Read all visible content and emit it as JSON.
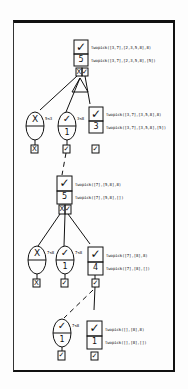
{
  "diagram": {
    "title": "",
    "nodes": {
      "n1": {
        "status_icon": "check",
        "count": "5",
        "goal": "twopick([3,7],[2,3,5,8],8)",
        "result": "twopick([3,7],[2,3,5,8],[5])",
        "children_marks": [
          "X",
          "✓"
        ]
      },
      "n1a": {
        "type": "test",
        "status_icon": "cross",
        "cond": "5<3",
        "count": "",
        "mark": "X"
      },
      "n1b": {
        "type": "test",
        "status_icon": "check",
        "cond": "3<8",
        "count": "1",
        "mark": "✓"
      },
      "n1c": {
        "status_icon": "check",
        "count": "3",
        "goal": "twopick([3,7],[3,5,8],8)",
        "result": "twopick([3,7],[3,5,8],[5])",
        "mark": "✓"
      },
      "n2": {
        "status_icon": "check",
        "count": "5",
        "goal": "twopick([7],[5,8],8)",
        "result": "twopick([7],[5,8],[])",
        "children_marks": [
          "X",
          "✓"
        ]
      },
      "n2a": {
        "type": "test",
        "status_icon": "cross",
        "cond": "7<8",
        "count": "",
        "mark": "X"
      },
      "n2b": {
        "type": "test",
        "status_icon": "check",
        "cond": "7<8",
        "count": "1",
        "mark": "✓"
      },
      "n2c": {
        "status_icon": "check",
        "count": "4",
        "goal": "twopick([7],[8],8)",
        "result": "twopick([7],[8],[])",
        "mark": "✓"
      },
      "n3a": {
        "type": "test",
        "status_icon": "check",
        "cond": "7<8",
        "count": "1",
        "mark": "✓"
      },
      "n3b": {
        "status_icon": "check",
        "count": "1",
        "goal": "twopick([],[8],8)",
        "result": "twopick([],[8],[])",
        "mark": "✓"
      }
    },
    "glyphs": {
      "check": "✓",
      "cross": "X"
    }
  }
}
